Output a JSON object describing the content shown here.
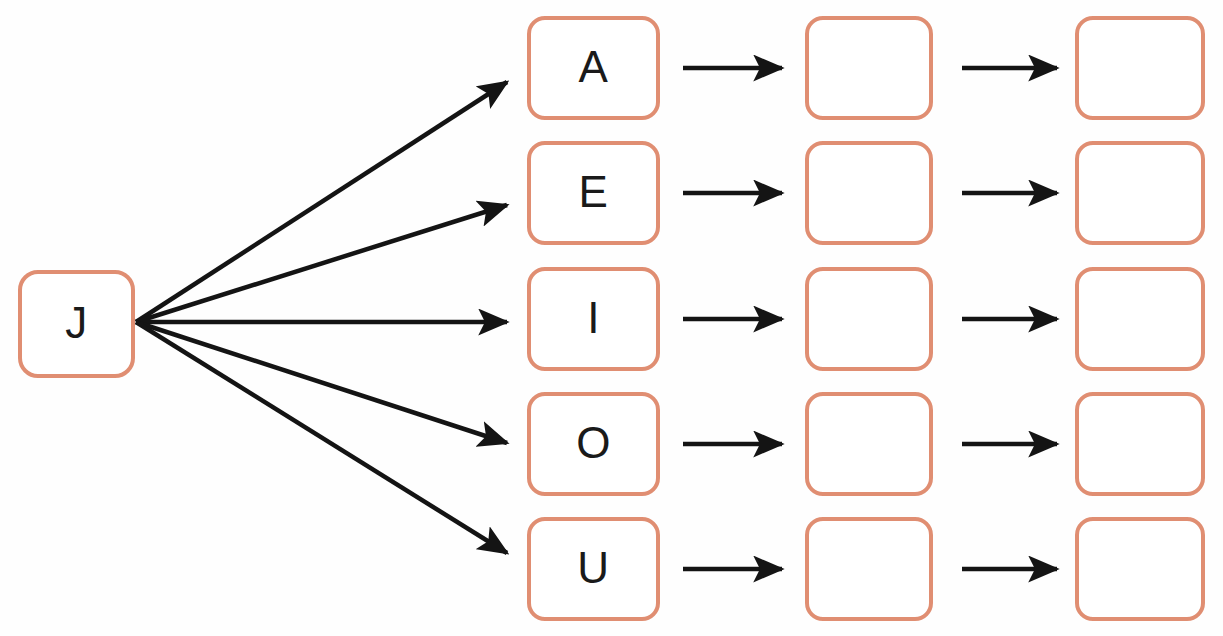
{
  "diagram": {
    "type": "fan-out-worksheet",
    "title": "",
    "canvas": {
      "width": 1223,
      "height": 636,
      "background": "#fefefe"
    },
    "style": {
      "node_border_color": "#e08e72",
      "node_fill_color": "#ffffff",
      "node_border_width": 4,
      "node_corner_radius": 18,
      "edge_color": "#141414",
      "text_color": "#1a1a1a"
    },
    "root": {
      "id": "root-j",
      "label": "J",
      "x": 18,
      "y": 270,
      "width": 117,
      "height": 108
    },
    "columns": [
      {
        "id": "column-letters",
        "x": 527,
        "width": 133,
        "filled": true
      },
      {
        "id": "column-blank-1",
        "x": 805,
        "width": 128,
        "filled": false
      },
      {
        "id": "column-blank-2",
        "x": 1075,
        "width": 130,
        "filled": false
      }
    ],
    "rows": [
      {
        "id": "row-a",
        "letter": "A",
        "y": 16,
        "height": 104,
        "center_y": 68
      },
      {
        "id": "row-e",
        "letter": "E",
        "y": 141,
        "height": 104,
        "center_y": 193
      },
      {
        "id": "row-i",
        "letter": "I",
        "y": 267,
        "height": 104,
        "center_y": 319
      },
      {
        "id": "row-o",
        "letter": "O",
        "y": 392,
        "height": 104,
        "center_y": 444
      },
      {
        "id": "row-u",
        "letter": "U",
        "y": 517,
        "height": 104,
        "center_y": 569
      }
    ],
    "fan_edges": [
      {
        "id": "edge-j-to-a",
        "from": "root-j",
        "to": "row-a",
        "x1": 136,
        "y1": 322,
        "x2": 507,
        "y2": 82
      },
      {
        "id": "edge-j-to-e",
        "from": "root-j",
        "to": "row-e",
        "x1": 136,
        "y1": 322,
        "x2": 507,
        "y2": 205
      },
      {
        "id": "edge-j-to-i",
        "from": "root-j",
        "to": "row-i",
        "x1": 136,
        "y1": 322,
        "x2": 507,
        "y2": 322
      },
      {
        "id": "edge-j-to-o",
        "from": "root-j",
        "to": "row-o",
        "x1": 136,
        "y1": 322,
        "x2": 507,
        "y2": 443
      },
      {
        "id": "edge-j-to-u",
        "from": "root-j",
        "to": "row-u",
        "x1": 136,
        "y1": 322,
        "x2": 507,
        "y2": 553
      }
    ],
    "chain_edges": [
      {
        "id": "edge-a-to-blank1",
        "row": "row-a",
        "x1": 683,
        "x2": 782,
        "y": 68
      },
      {
        "id": "edge-blank1-to-blank2",
        "row": "row-a",
        "x1": 962,
        "x2": 1057,
        "y": 68
      },
      {
        "id": "edge-e-to-blank1",
        "row": "row-e",
        "x1": 683,
        "x2": 782,
        "y": 193
      },
      {
        "id": "edge-blank1-to-blank2-e",
        "row": "row-e",
        "x1": 962,
        "x2": 1057,
        "y": 193
      },
      {
        "id": "edge-i-to-blank1",
        "row": "row-i",
        "x1": 683,
        "x2": 782,
        "y": 319
      },
      {
        "id": "edge-blank1-to-blank2-i",
        "row": "row-i",
        "x1": 962,
        "x2": 1057,
        "y": 319
      },
      {
        "id": "edge-o-to-blank1",
        "row": "row-o",
        "x1": 683,
        "x2": 782,
        "y": 444
      },
      {
        "id": "edge-blank1-to-blank2-o",
        "row": "row-o",
        "x1": 962,
        "x2": 1057,
        "y": 444
      },
      {
        "id": "edge-u-to-blank1",
        "row": "row-u",
        "x1": 683,
        "x2": 782,
        "y": 569
      },
      {
        "id": "edge-blank1-to-blank2-u",
        "row": "row-u",
        "x1": 962,
        "x2": 1057,
        "y": 569
      }
    ],
    "nodes": {
      "letters": [
        "A",
        "E",
        "I",
        "O",
        "U"
      ],
      "blank_column_1": [
        "",
        "",
        "",
        "",
        ""
      ],
      "blank_column_2": [
        "",
        "",
        "",
        "",
        ""
      ]
    }
  }
}
